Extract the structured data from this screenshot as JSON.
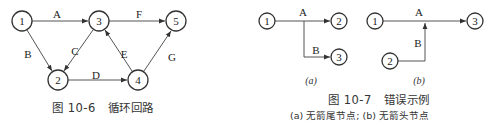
{
  "figure_10_6": {
    "caption_number": "图 10-6",
    "caption_title": "循环回路",
    "nodes": [
      {
        "id": "1",
        "label": "1",
        "x": 22,
        "y": 21
      },
      {
        "id": "3",
        "label": "3",
        "x": 99,
        "y": 21
      },
      {
        "id": "5",
        "label": "5",
        "x": 176,
        "y": 21
      },
      {
        "id": "2",
        "label": "2",
        "x": 58,
        "y": 80
      },
      {
        "id": "4",
        "label": "4",
        "x": 138,
        "y": 80
      }
    ],
    "edges": [
      {
        "from": "1",
        "to": "3",
        "label": "A"
      },
      {
        "from": "1",
        "to": "2",
        "label": "B"
      },
      {
        "from": "3",
        "to": "2",
        "label": "C"
      },
      {
        "from": "2",
        "to": "4",
        "label": "D"
      },
      {
        "from": "4",
        "to": "3",
        "label": "E"
      },
      {
        "from": "3",
        "to": "5",
        "label": "F"
      },
      {
        "from": "4",
        "to": "5",
        "label": "G"
      }
    ]
  },
  "figure_10_7": {
    "caption_number": "图 10-7",
    "caption_title": "错误示例",
    "caption_sub": "(a) 无箭尾节点; (b) 无箭头节点",
    "sub_a": {
      "label": "(a)",
      "nodes": [
        {
          "id": "1",
          "label": "1"
        },
        {
          "id": "2",
          "label": "2"
        },
        {
          "id": "3",
          "label": "3"
        }
      ],
      "edges": [
        {
          "from": "1",
          "to": "2",
          "label": "A"
        },
        {
          "from": "A-branch",
          "to": "3",
          "label": "B"
        }
      ]
    },
    "sub_b": {
      "label": "(b)",
      "nodes": [
        {
          "id": "1",
          "label": "1"
        },
        {
          "id": "2",
          "label": "2"
        },
        {
          "id": "3",
          "label": "3"
        }
      ],
      "edges": [
        {
          "from": "1",
          "to": "3",
          "label": "A"
        },
        {
          "from": "2",
          "to": "A-midpoint",
          "label": "B"
        }
      ]
    }
  }
}
